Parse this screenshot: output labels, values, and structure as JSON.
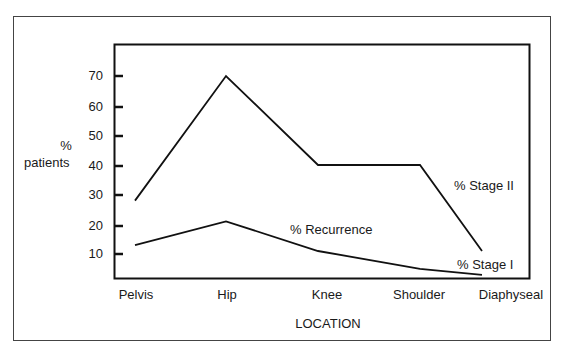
{
  "chart_data": {
    "type": "line",
    "title": "",
    "xlabel": "LOCATION",
    "ylabel": "% patients",
    "categories": [
      "Pelvis",
      "Hip",
      "Knee",
      "Shoulder",
      "Diaphyseal"
    ],
    "series": [
      {
        "name": "% Stage II",
        "values": [
          28,
          70,
          40,
          40,
          11
        ]
      },
      {
        "name": "% Recurrence",
        "values": [
          13,
          21,
          11,
          5,
          3
        ]
      }
    ],
    "yticks": [
      "70",
      "60",
      "50",
      "40",
      "30",
      "20",
      "10"
    ],
    "ylim": [
      2,
      78
    ],
    "grid": false,
    "legend": "inline labels",
    "annotations": [
      "% Stage II",
      "% Recurrence",
      "% Stage I"
    ]
  },
  "labels": {
    "ylabel_line1": "%",
    "ylabel_line2": "patients",
    "xlabel": "LOCATION",
    "stage2": "% Stage II",
    "recurrence": "% Recurrence",
    "stage1": "% Stage I"
  },
  "yticks": [
    "70",
    "60",
    "50",
    "40",
    "30",
    "20",
    "10"
  ],
  "xticks": [
    "Pelvis",
    "Hip",
    "Knee",
    "Shoulder",
    "Diaphyseal"
  ]
}
